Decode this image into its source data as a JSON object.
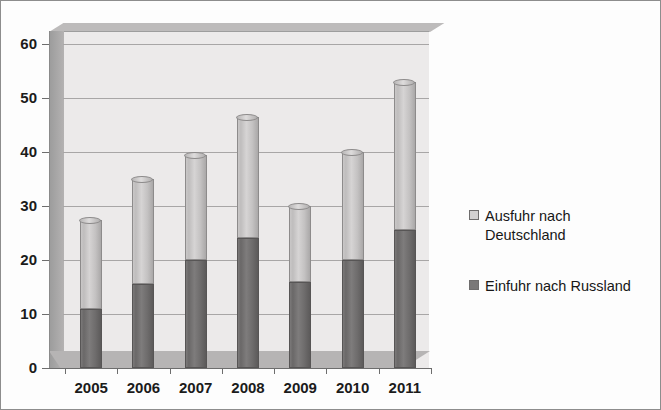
{
  "chart_data": {
    "type": "bar",
    "subtype": "stacked-column-3d",
    "title": "",
    "xlabel": "",
    "ylabel": "",
    "categories": [
      "2005",
      "2006",
      "2007",
      "2008",
      "2009",
      "2010",
      "2011"
    ],
    "series": [
      {
        "name": "Einfuhr nach Russland",
        "color": "#7a7878",
        "values": [
          11,
          15.5,
          20,
          24,
          16,
          20,
          25.5
        ]
      },
      {
        "name": "Ausfuhr nach Deutschland",
        "color": "#d3d1d1",
        "values": [
          16.5,
          19.5,
          19.5,
          22.5,
          14,
          20,
          27.5
        ]
      }
    ],
    "totals": [
      27.5,
      35,
      39.5,
      46.5,
      30,
      40,
      53
    ],
    "ylim": [
      0,
      60
    ],
    "ytick_labels": [
      "0",
      "10",
      "20",
      "30",
      "40",
      "50",
      "60"
    ],
    "ytick_values": [
      0,
      10,
      20,
      30,
      40,
      50,
      60
    ],
    "grid": true,
    "legend_position": "right"
  },
  "legend": {
    "items": [
      {
        "label": "Ausfuhr nach Deutschland",
        "swatch": "light-gray-swatch"
      },
      {
        "label": "Einfuhr nach Russland",
        "swatch": "dark-gray-swatch"
      }
    ]
  }
}
